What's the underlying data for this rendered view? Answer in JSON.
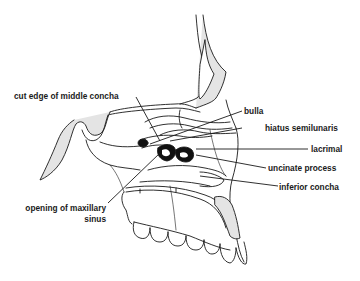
{
  "diagram": {
    "type": "anatomical-illustration",
    "labels": {
      "cut_edge": "cut edge of middle concha",
      "bulla": "bulla",
      "hiatus": "hiatus semilunaris",
      "lacrimal": "lacrimal",
      "uncinate": "uncinate process",
      "inferior_concha": "inferior concha",
      "opening_line1": "opening of maxillary",
      "opening_line2": "sinus"
    },
    "colors": {
      "line": "#1a1a1a",
      "bone_fill": "#e4e4e4",
      "dark_fill": "#111111",
      "background": "#ffffff"
    }
  }
}
